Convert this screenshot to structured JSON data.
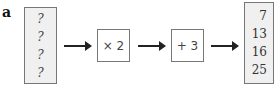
{
  "diagram": {
    "part_label": "a",
    "input_values": [
      "?",
      "?",
      "?",
      "?"
    ],
    "operations": [
      {
        "label": "× 2"
      },
      {
        "label": "+ 3"
      }
    ],
    "output_values": [
      "7",
      "13",
      "16",
      "25"
    ]
  }
}
